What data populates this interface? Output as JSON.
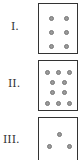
{
  "figures": [
    {
      "label": "I.",
      "label_pos": {
        "x": 11,
        "y": 21
      },
      "box": {
        "x": 38,
        "y": 3,
        "w": 40,
        "h": 51
      },
      "dot_count": 6,
      "dots": [
        [
          10,
          12
        ],
        [
          25,
          12
        ],
        [
          10,
          26
        ],
        [
          25,
          26
        ],
        [
          10,
          40
        ],
        [
          25,
          40
        ]
      ]
    },
    {
      "label": "II.",
      "label_pos": {
        "x": 8,
        "y": 78
      },
      "box": {
        "x": 38,
        "y": 60,
        "w": 40,
        "h": 51
      },
      "dot_count": 10,
      "dots": [
        [
          6,
          9
        ],
        [
          17,
          9
        ],
        [
          28,
          9
        ],
        [
          11,
          19
        ],
        [
          23,
          19
        ],
        [
          11,
          29
        ],
        [
          23,
          29
        ],
        [
          6,
          40
        ],
        [
          17,
          40
        ],
        [
          28,
          40
        ]
      ]
    },
    {
      "label": "III.",
      "label_pos": {
        "x": 3,
        "y": 134
      },
      "box": {
        "x": 38,
        "y": 117,
        "w": 40,
        "h": 48
      },
      "dot_count": 3,
      "dots": [
        [
          18,
          14
        ],
        [
          8,
          26
        ],
        [
          28,
          26
        ]
      ]
    }
  ],
  "colors": {
    "border": "#333333",
    "dot_fill": "#9a9a9a",
    "dot_stroke": "#777777"
  }
}
